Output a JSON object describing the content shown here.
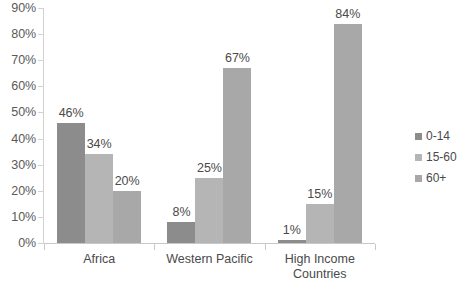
{
  "chart_data": {
    "type": "bar",
    "title": "",
    "subtitle": "",
    "xlabel": "",
    "ylabel": "",
    "categories": [
      "Africa",
      "Western Pacific",
      "High Income Countries"
    ],
    "series": [
      {
        "name": "0-14",
        "values": [
          46,
          8,
          1
        ],
        "color": "#8c8c8c"
      },
      {
        "name": "15-60",
        "values": [
          34,
          25,
          15
        ],
        "color": "#b5b5b5"
      },
      {
        "name": "60+",
        "values": [
          20,
          67,
          84
        ],
        "color": "#a8a8a8"
      }
    ],
    "value_labels": [
      [
        "46%",
        "34%",
        "20%"
      ],
      [
        "8%",
        "25%",
        "67%"
      ],
      [
        "1%",
        "15%",
        "84%"
      ]
    ],
    "ylim": [
      0,
      90
    ],
    "ytick_values": [
      0,
      10,
      20,
      30,
      40,
      50,
      60,
      70,
      80,
      90
    ],
    "ytick_labels": [
      "0%",
      "10%",
      "20%",
      "30%",
      "40%",
      "50%",
      "60%",
      "70%",
      "80%",
      "90%"
    ],
    "grid": false,
    "legend_position": "right",
    "legend_entries": [
      "0-14",
      "15-60",
      "60+"
    ],
    "axis_color": "#c8c8c8",
    "text_color": "#4a4a4a",
    "background": "#ffffff"
  }
}
